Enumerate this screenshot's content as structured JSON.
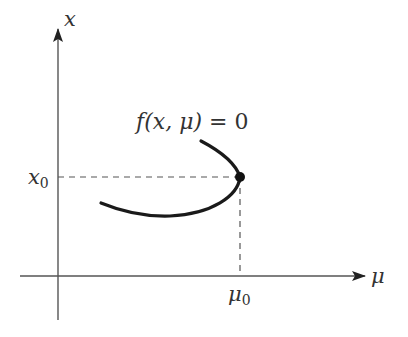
{
  "figure": {
    "type": "bifurcation-diagram"
  },
  "axes": {
    "vertical_label": "x",
    "horizontal_label": "μ",
    "vertical_tick_label": {
      "base": "x",
      "sub": "0"
    },
    "horizontal_tick_label": {
      "base": "μ",
      "sub": "0"
    }
  },
  "curve": {
    "equation_label": {
      "f": "f",
      "args": "(x, μ)",
      "equals": " = 0"
    },
    "turning_point": "(μ0, x0)"
  },
  "colors": {
    "axis": "#555555",
    "curve": "#1a1a1a",
    "dashed": "#555555",
    "text": "#333333"
  }
}
